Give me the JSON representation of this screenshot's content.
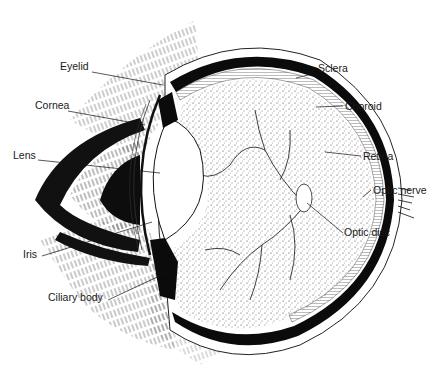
{
  "diagram": {
    "colors": {
      "ink": "#111111",
      "paper": "#ffffff",
      "stipple": "#555555"
    },
    "labels": [
      {
        "id": "eyelid",
        "text": "Eyelid",
        "x": 60,
        "y": 66,
        "side": "left"
      },
      {
        "id": "cornea",
        "text": "Cornea",
        "x": 35,
        "y": 105,
        "side": "left"
      },
      {
        "id": "lens",
        "text": "Lens",
        "x": 13,
        "y": 154,
        "side": "left"
      },
      {
        "id": "iris",
        "text": "Iris",
        "x": 23,
        "y": 251,
        "side": "left"
      },
      {
        "id": "ciliary-body",
        "text": "Ciliary body",
        "x": 48,
        "y": 294,
        "side": "left"
      },
      {
        "id": "sclera",
        "text": "Sclera",
        "x": 318,
        "y": 67,
        "side": "right"
      },
      {
        "id": "choroid",
        "text": "Choroid",
        "x": 345,
        "y": 100,
        "side": "right"
      },
      {
        "id": "retina",
        "text": "Retina",
        "x": 363,
        "y": 150,
        "side": "right"
      },
      {
        "id": "optic-nerve",
        "text": "Optic nerve",
        "x": 373,
        "y": 183,
        "side": "right"
      },
      {
        "id": "optic-disc",
        "text": "Optic disc",
        "x": 344,
        "y": 227,
        "side": "right"
      }
    ]
  }
}
